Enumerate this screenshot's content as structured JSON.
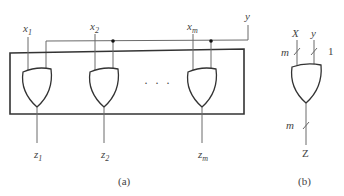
{
  "figure_a": {
    "caption": "(a)",
    "control_input": "y",
    "gates": [
      {
        "input": "x",
        "input_sub": "1",
        "output": "z",
        "output_sub": "1"
      },
      {
        "input": "x",
        "input_sub": "2",
        "output": "z",
        "output_sub": "2"
      },
      {
        "input": "x",
        "input_sub": "m",
        "output": "z",
        "output_sub": "m"
      }
    ],
    "ellipsis": "· · ·",
    "gate_type": "OR"
  },
  "figure_b": {
    "caption": "(b)",
    "input_x": "X",
    "input_y": "y",
    "input_x_width": "m",
    "input_y_width": "1",
    "output": "Z",
    "output_width": "m",
    "gate_type": "OR"
  }
}
